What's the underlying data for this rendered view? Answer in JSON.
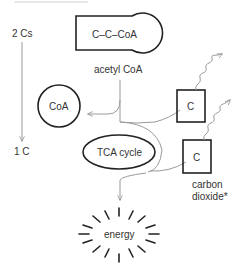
{
  "diagram": {
    "left_arrow": {
      "top_label": "2 Cs",
      "bottom_label": "1 C"
    },
    "acetyl_coa_shape": {
      "text": "C–C–CoA",
      "caption": "acetyl CoA"
    },
    "coa_circle": {
      "text": "CoA"
    },
    "tca_cycle": {
      "text": "TCA cycle"
    },
    "carbon_boxes": [
      {
        "text": "C"
      },
      {
        "text": "C"
      }
    ],
    "carbon_caption_line1": "carbon",
    "carbon_caption_line2": "dioxide*",
    "energy": {
      "text": "energy"
    },
    "colors": {
      "outline": "#222222",
      "arrow": "#9a9a9a",
      "text": "#333333"
    }
  }
}
